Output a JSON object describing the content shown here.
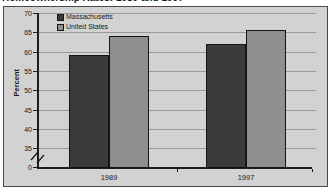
{
  "title": "Homeownership Rates: 1989 and 1997",
  "chart_data": {
    "type": "bar",
    "title": "Homeownership Rates: 1989 and 1997",
    "categories": [
      "1989",
      "1997"
    ],
    "series": [
      {
        "name": "Massachusetts",
        "color": "#3b3b3b",
        "values": [
          59,
          62
        ]
      },
      {
        "name": "United States",
        "color": "#8f8f8f",
        "values": [
          64,
          65.5
        ]
      }
    ],
    "xlabel": "",
    "ylabel": "Percent",
    "y_axis": {
      "ticks": [
        0,
        35,
        40,
        45,
        50,
        55,
        60,
        65,
        70
      ],
      "break_between": [
        0,
        35
      ],
      "display_range": [
        35,
        70
      ]
    },
    "grid": true,
    "legend_position": "top-left",
    "colors": {
      "plot_background": "#d2d2d2",
      "gridline": "#9a9a9a",
      "axis": "#1c1c1c",
      "text": "#1a1a1a",
      "frame_border": "#4a4a4a"
    }
  }
}
